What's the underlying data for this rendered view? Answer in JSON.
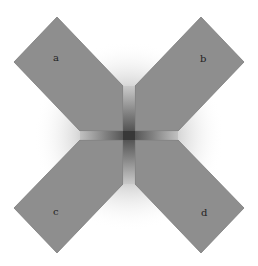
{
  "figure": {
    "background": "#ffffff",
    "shape_fill": "#8c8c8c",
    "shape_stroke": "#7a7a7a",
    "glow_color": "#3a3a3a",
    "gap_color": "#a8a8a8",
    "labels": {
      "a": "a",
      "b": "b",
      "c": "c",
      "d": "d"
    }
  }
}
